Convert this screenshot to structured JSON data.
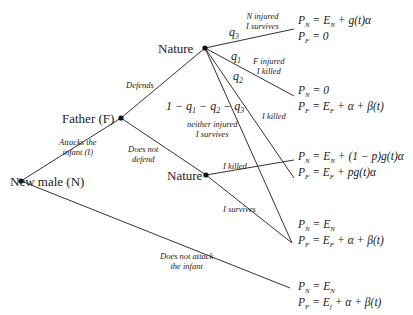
{
  "diagram": {
    "type": "game-tree",
    "nodes": {
      "new_male": "New male (N)",
      "father": "Father (F)",
      "nature_top": "Nature",
      "nature_bottom": "Nature"
    },
    "actions": {
      "attacks": "Attacks the infant (I)",
      "attacks_l1": "Attacks the",
      "attacks_l2": "infant (I)",
      "no_attack_l1": "Does not attack",
      "no_attack_l2": "the infant",
      "defends": "Defends",
      "no_defend_l1": "Does not",
      "no_defend_l2": "defend",
      "n_injured_l1": "N injured",
      "n_injured_l2": "I survives",
      "f_injured_l1": "F injured",
      "f_injured_l2": "I killed",
      "i_killed_q2": "I killed",
      "neither_l1": "neither injured",
      "neither_l2": "I survives",
      "i_killed_nature": "I killed",
      "i_survives_nature": "I survives"
    },
    "probabilities": {
      "q3": "q3",
      "q1": "q1",
      "q2": "q2",
      "rest": "1 − q1 − q2 − q3"
    },
    "payoffs": [
      {
        "pn": "PN = EN + g(t)α",
        "pf": "PF = 0"
      },
      {
        "pn": "PN = 0",
        "pf": "PF = EF + α + β(t)"
      },
      {
        "pn": "PN = EN + (1 − p)g(t)α",
        "pf": "PF = EF + pg(t)α"
      },
      {
        "pn": "PN = EN",
        "pf": "PF = EF + α + β(t)"
      },
      {
        "pn": "PN = EN",
        "pf": "PF = Ef + α + β(t)"
      }
    ]
  }
}
